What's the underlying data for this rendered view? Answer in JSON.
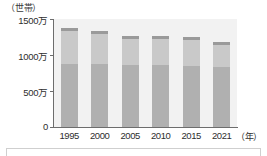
{
  "chart_data": {
    "type": "bar",
    "title": "",
    "subtitle": "",
    "unit_label": "（世帯）",
    "xlabel": "（年）",
    "ylabel": "",
    "categories": [
      "1995",
      "2000",
      "2005",
      "2010",
      "2015",
      "2021"
    ],
    "values": [
      1370,
      1330,
      1270,
      1265,
      1250,
      1180
    ],
    "value_unit": "万世帯",
    "series": [
      {
        "name": "下段",
        "values": [
          880,
          870,
          860,
          855,
          850,
          840
        ]
      },
      {
        "name": "上段",
        "values": [
          490,
          460,
          410,
          410,
          400,
          340
        ]
      }
    ],
    "ylim": [
      0,
      1500
    ],
    "yticks": [
      0,
      500,
      1000,
      1500
    ],
    "ytick_labels": [
      "0",
      "500万",
      "1000万",
      "1500万"
    ],
    "grid": false,
    "legend": "none",
    "colors": {
      "bar_top": "#c9c9c9",
      "bar_bottom": "#b0b0b0",
      "bar_cap": "#9a9a9a",
      "plot_background": "#f2f2f2",
      "axis": "#6d6d6d",
      "text": "#2e2e2e"
    }
  }
}
